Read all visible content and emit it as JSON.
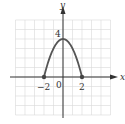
{
  "chart_data": {
    "type": "line",
    "title": "",
    "function": "y = 4 - x^2",
    "xlabel": "x",
    "ylabel": "y",
    "xlim": [
      -5,
      5
    ],
    "ylim": [
      -4,
      6
    ],
    "grid": true,
    "series": [
      {
        "name": "parabola",
        "x": [
          -2,
          -1.5,
          -1,
          -0.5,
          0,
          0.5,
          1,
          1.5,
          2
        ],
        "y": [
          0,
          1.75,
          3,
          3.75,
          4,
          3.75,
          3,
          1.75,
          0
        ],
        "endpoints": [
          {
            "x": -2,
            "y": 0,
            "filled": true
          },
          {
            "x": 2,
            "y": 0,
            "filled": true
          }
        ]
      }
    ],
    "tick_labels": {
      "x": [
        "-2",
        "0",
        "2"
      ],
      "y": [
        "4"
      ]
    }
  },
  "labels": {
    "x_axis": "x",
    "y_axis": "y",
    "y_tick_4": "4",
    "x_tick_neg2": "−2",
    "origin": "0",
    "x_tick_2": "2"
  },
  "colors": {
    "grid": "#d8d8d8",
    "axis": "#333333",
    "curve": "#555555"
  }
}
